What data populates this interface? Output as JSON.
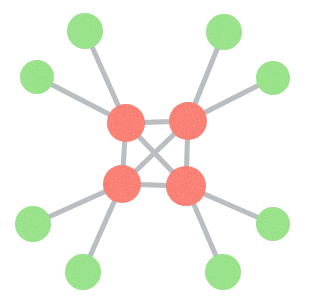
{
  "figure": {
    "kind": "network-graph",
    "width": 310,
    "height": 305,
    "background_color": "#FFFFFF"
  },
  "style": {
    "red_node_color": "#F96F60",
    "green_node_color": "#8DE07C",
    "edge_color": "#B5B9BD",
    "edge_width": 5,
    "node_texture": "grainy-stipple"
  },
  "legend": {
    "red_label": "hub node",
    "green_label": "leaf node"
  },
  "chart_data": {
    "type": "graph",
    "title": "",
    "node_count": 12,
    "edge_count": 14,
    "layout": "spring",
    "nodes": [
      {
        "id": "r1",
        "label": "",
        "group": "hub",
        "color": "#F96F60",
        "x": 126,
        "y": 123,
        "r": 19,
        "degree": 5
      },
      {
        "id": "r2",
        "label": "",
        "group": "hub",
        "color": "#F96F60",
        "x": 188,
        "y": 121,
        "r": 19,
        "degree": 5
      },
      {
        "id": "r3",
        "label": "",
        "group": "hub",
        "color": "#F96F60",
        "x": 122,
        "y": 184,
        "r": 19,
        "degree": 5
      },
      {
        "id": "r4",
        "label": "",
        "group": "hub",
        "color": "#F96F60",
        "x": 186,
        "y": 186,
        "r": 20,
        "degree": 5
      },
      {
        "id": "g1",
        "label": "",
        "group": "leaf",
        "color": "#8DE07C",
        "x": 85,
        "y": 31,
        "r": 18,
        "degree": 1
      },
      {
        "id": "g2",
        "label": "",
        "group": "leaf",
        "color": "#8DE07C",
        "x": 37,
        "y": 77,
        "r": 17,
        "degree": 1
      },
      {
        "id": "g3",
        "label": "",
        "group": "leaf",
        "color": "#8DE07C",
        "x": 224,
        "y": 32,
        "r": 18,
        "degree": 1
      },
      {
        "id": "g4",
        "label": "",
        "group": "leaf",
        "color": "#8DE07C",
        "x": 273,
        "y": 78,
        "r": 17,
        "degree": 1
      },
      {
        "id": "g5",
        "label": "",
        "group": "leaf",
        "color": "#8DE07C",
        "x": 33,
        "y": 224,
        "r": 18,
        "degree": 1
      },
      {
        "id": "g6",
        "label": "",
        "group": "leaf",
        "color": "#8DE07C",
        "x": 83,
        "y": 272,
        "r": 18,
        "degree": 1
      },
      {
        "id": "g7",
        "label": "",
        "group": "leaf",
        "color": "#8DE07C",
        "x": 273,
        "y": 224,
        "r": 17,
        "degree": 1
      },
      {
        "id": "g8",
        "label": "",
        "group": "leaf",
        "color": "#8DE07C",
        "x": 223,
        "y": 272,
        "r": 18,
        "degree": 1
      }
    ],
    "edges": [
      {
        "source": "r1",
        "target": "r2",
        "kind": "hub-hub"
      },
      {
        "source": "r1",
        "target": "r3",
        "kind": "hub-hub"
      },
      {
        "source": "r1",
        "target": "r4",
        "kind": "hub-hub"
      },
      {
        "source": "r2",
        "target": "r3",
        "kind": "hub-hub"
      },
      {
        "source": "r2",
        "target": "r4",
        "kind": "hub-hub"
      },
      {
        "source": "r3",
        "target": "r4",
        "kind": "hub-hub"
      },
      {
        "source": "r1",
        "target": "g1",
        "kind": "hub-leaf"
      },
      {
        "source": "r1",
        "target": "g2",
        "kind": "hub-leaf"
      },
      {
        "source": "r2",
        "target": "g3",
        "kind": "hub-leaf"
      },
      {
        "source": "r2",
        "target": "g4",
        "kind": "hub-leaf"
      },
      {
        "source": "r3",
        "target": "g5",
        "kind": "hub-leaf"
      },
      {
        "source": "r3",
        "target": "g6",
        "kind": "hub-leaf"
      },
      {
        "source": "r4",
        "target": "g7",
        "kind": "hub-leaf"
      },
      {
        "source": "r4",
        "target": "g8",
        "kind": "hub-leaf"
      }
    ]
  }
}
